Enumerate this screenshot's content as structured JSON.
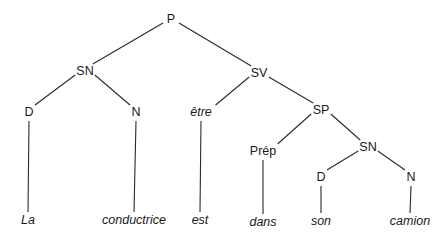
{
  "diagram": {
    "type": "syntax-tree",
    "nodes": [
      {
        "id": "P",
        "label": "P",
        "italic": false
      },
      {
        "id": "SN1",
        "label": "SN",
        "italic": false
      },
      {
        "id": "SV",
        "label": "SV",
        "italic": false
      },
      {
        "id": "D1",
        "label": "D",
        "italic": false
      },
      {
        "id": "N1",
        "label": "N",
        "italic": false
      },
      {
        "id": "etre",
        "label": "être",
        "italic": true
      },
      {
        "id": "SP",
        "label": "SP",
        "italic": false
      },
      {
        "id": "Prep",
        "label": "Prép",
        "italic": false
      },
      {
        "id": "SN2",
        "label": "SN",
        "italic": false
      },
      {
        "id": "D2",
        "label": "D",
        "italic": false
      },
      {
        "id": "N2",
        "label": "N",
        "italic": false
      },
      {
        "id": "La",
        "label": "La",
        "italic": true
      },
      {
        "id": "conductrice",
        "label": "conductrice",
        "italic": true
      },
      {
        "id": "est",
        "label": "est",
        "italic": true
      },
      {
        "id": "dans",
        "label": "dans",
        "italic": true
      },
      {
        "id": "son",
        "label": "son",
        "italic": true
      },
      {
        "id": "camion",
        "label": "camion",
        "italic": true
      }
    ],
    "edges": [
      [
        "P",
        "SN1"
      ],
      [
        "P",
        "SV"
      ],
      [
        "SN1",
        "D1"
      ],
      [
        "SN1",
        "N1"
      ],
      [
        "SV",
        "etre"
      ],
      [
        "SV",
        "SP"
      ],
      [
        "SP",
        "Prep"
      ],
      [
        "SP",
        "SN2"
      ],
      [
        "SN2",
        "D2"
      ],
      [
        "SN2",
        "N2"
      ],
      [
        "D1",
        "La"
      ],
      [
        "N1",
        "conductrice"
      ],
      [
        "etre",
        "est"
      ],
      [
        "Prep",
        "dans"
      ],
      [
        "D2",
        "son"
      ],
      [
        "N2",
        "camion"
      ]
    ],
    "sentence": "La conductrice est dans son camion"
  }
}
